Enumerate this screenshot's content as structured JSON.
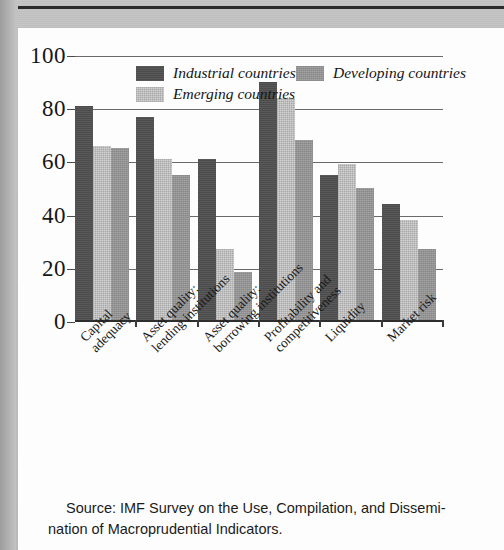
{
  "chart_data": {
    "type": "bar",
    "title": "",
    "xlabel": "",
    "ylabel": "",
    "ylim": [
      0,
      100
    ],
    "yticks": [
      "0",
      "20",
      "40",
      "60",
      "80",
      "100"
    ],
    "grid": true,
    "legend_position": "top-inside",
    "categories": [
      "Capital adequacy",
      "Asset quality: lending institutions",
      "Asset quality: borrowing institutions",
      "Profitability and competitiveness",
      "Liquidity",
      "Market risk"
    ],
    "series": [
      {
        "name": "Industrial countries",
        "color": "#4c4c4c",
        "values": [
          81,
          77,
          61,
          90,
          55,
          44
        ]
      },
      {
        "name": "Emerging countries",
        "color": "#d2d2d2",
        "values": [
          66,
          61,
          27,
          84,
          59,
          38
        ]
      },
      {
        "name": "Developing countries",
        "color": "#989898",
        "values": [
          65,
          55,
          18,
          68,
          50,
          27
        ]
      }
    ]
  },
  "legend": {
    "items": [
      {
        "label": "Industrial countries",
        "swatch": "industrial"
      },
      {
        "label": "Developing countries",
        "swatch": "developing"
      },
      {
        "label": "Emerging countries",
        "swatch": "emerging"
      }
    ]
  },
  "axis": {
    "y_ticks": [
      "100",
      "80",
      "60",
      "40",
      "20",
      "0"
    ]
  },
  "category_labels": [
    {
      "line1": "Capital",
      "line2": "adequacy"
    },
    {
      "line1": "Asset quality:",
      "line2": "lending institutions"
    },
    {
      "line1": "Asset quality:",
      "line2": "borrowing institutions"
    },
    {
      "line1": "Profitability and",
      "line2": "competitiveness"
    },
    {
      "line1": "Liquidity",
      "line2": ""
    },
    {
      "line1": "Market risk",
      "line2": ""
    }
  ],
  "source": {
    "line1": "Source: IMF Survey on the Use, Compilation, and Dissemi-",
    "line2": "nation of Macroprudential Indicators."
  }
}
